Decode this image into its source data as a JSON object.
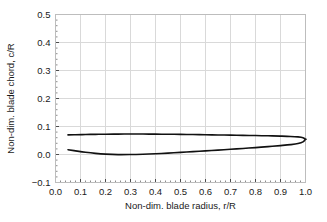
{
  "chart_data": {
    "type": "line",
    "title": "",
    "xlabel": "Non-dim. blade radius, r/R",
    "ylabel": "Non-dim. blade chord, c/R",
    "xlim": [
      0.0,
      1.0
    ],
    "ylim": [
      -0.1,
      0.5
    ],
    "xticks": [
      0.0,
      0.1,
      0.2,
      0.3,
      0.4,
      0.5,
      0.6,
      0.7,
      0.8,
      0.9,
      1.0
    ],
    "xtick_labels": [
      "0.0",
      "0.1",
      "0.2",
      "0.3",
      "0.4",
      "0.5",
      "0.6",
      "0.7",
      "0.8",
      "0.9",
      "1.0"
    ],
    "yticks": [
      -0.1,
      0.0,
      0.1,
      0.2,
      0.3,
      0.4,
      0.5
    ],
    "ytick_labels": [
      "-0.1",
      "0.0",
      "0.1",
      "0.2",
      "0.3",
      "0.4",
      "0.5"
    ],
    "grid": true,
    "minor_ticks": true,
    "minor_ticks_per_interval": 5,
    "legend": null,
    "line_color": "#111111",
    "line_width": 1.6,
    "grid_color": "#d9d9d9",
    "frame_color": "#bdbdbd",
    "series": [
      {
        "name": "Leading edge (upper)",
        "x": [
          0.05,
          0.08,
          0.12,
          0.16,
          0.2,
          0.25,
          0.3,
          0.35,
          0.4,
          0.45,
          0.5,
          0.55,
          0.6,
          0.65,
          0.7,
          0.75,
          0.8,
          0.85,
          0.9,
          0.94,
          0.97,
          0.99,
          1.0
        ],
        "values": [
          0.07,
          0.0706,
          0.0714,
          0.072,
          0.0725,
          0.0729,
          0.073,
          0.073,
          0.0727,
          0.0723,
          0.0718,
          0.0712,
          0.0706,
          0.0699,
          0.0692,
          0.0684,
          0.0676,
          0.0667,
          0.0656,
          0.0645,
          0.0628,
          0.06,
          0.0545
        ]
      },
      {
        "name": "Trailing edge (lower)",
        "x": [
          0.05,
          0.08,
          0.12,
          0.16,
          0.2,
          0.25,
          0.3,
          0.35,
          0.4,
          0.45,
          0.5,
          0.55,
          0.6,
          0.65,
          0.7,
          0.75,
          0.8,
          0.85,
          0.9,
          0.94,
          0.97,
          0.99,
          1.0
        ],
        "values": [
          0.017,
          0.013,
          0.008,
          0.004,
          0.0012,
          -0.0005,
          -0.0002,
          0.001,
          0.0028,
          0.005,
          0.0075,
          0.0101,
          0.0128,
          0.0156,
          0.0185,
          0.0215,
          0.0247,
          0.028,
          0.0318,
          0.0352,
          0.039,
          0.045,
          0.0545
        ]
      }
    ],
    "root_cap": {
      "x": 0.05,
      "y0": 0.017,
      "y1": 0.07,
      "closed": false
    },
    "tip_cap": {
      "x": 1.0,
      "rounded": true
    }
  }
}
